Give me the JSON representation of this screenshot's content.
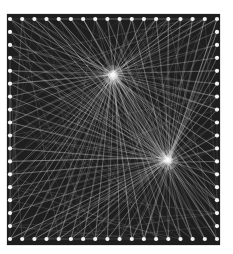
{
  "image": {
    "subject": "string art board",
    "description": "Square dark board with a border of white nails; white threads fan out from two bright focal points",
    "background_color": "#ffffff",
    "board_color": "#1e1e1e",
    "thread_color": "#e8e8e8",
    "nail_color": "#f4f4f4"
  },
  "board": {
    "left": 7,
    "top": 14,
    "right": 220,
    "bottom": 245,
    "nail_inset": {
      "top": 19,
      "left": 10,
      "bottom": 239,
      "right": 217
    },
    "nails_per_side": {
      "top": 18,
      "bottom": 18,
      "left": 18,
      "right": 18
    }
  },
  "focal_points": [
    {
      "name": "upper-focal-point",
      "x": 113,
      "y": 75
    },
    {
      "name": "lower-focal-point",
      "x": 168,
      "y": 160
    }
  ]
}
